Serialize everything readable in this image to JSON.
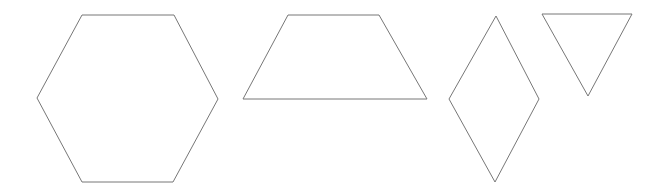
{
  "canvas": {
    "width": 661,
    "height": 193,
    "background": "#ffffff"
  },
  "style": {
    "stroke": "#777777"
  },
  "shapes": [
    {
      "type": "hexagon",
      "points": "82,15 174,15 218,99 173,182 82,182 37,98"
    },
    {
      "type": "trapezoid",
      "points": "288,15 379,15 427,99 243,99"
    },
    {
      "type": "rhombus",
      "points": "496,16 539,99 495,182 449,99"
    },
    {
      "type": "triangle",
      "points": "542,14 632,14 588,96"
    }
  ]
}
